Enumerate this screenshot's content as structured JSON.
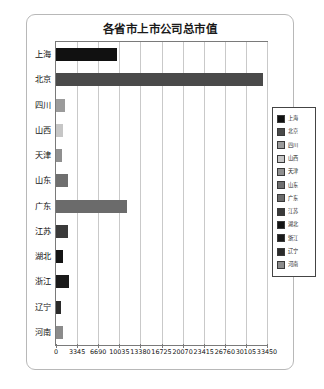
{
  "chart_data": {
    "type": "bar",
    "orientation": "horizontal",
    "title": "各省市上市公司总市值",
    "xlabel": "",
    "ylabel": "",
    "categories": [
      "上海",
      "北京",
      "四川",
      "山西",
      "天津",
      "山东",
      "广东",
      "江苏",
      "湖北",
      "浙江",
      "辽宁",
      "河南"
    ],
    "values": [
      9690,
      32800,
      1460,
      1060,
      900,
      1850,
      11280,
      1900,
      1060,
      2000,
      830,
      1060
    ],
    "colors": [
      "#111111",
      "#4a4a4a",
      "#9b9b9b",
      "#c6c6c6",
      "#8f8f8f",
      "#6f6f6f",
      "#6b6b6b",
      "#3a3a3a",
      "#141414",
      "#1a1a1a",
      "#2b2b2b",
      "#8b8b8b"
    ],
    "xlim": [
      0,
      33450
    ],
    "xticks": [
      0,
      3345,
      6690,
      10035,
      13380,
      16725,
      20070,
      23415,
      26760,
      30105,
      33450
    ],
    "xtick_labels": [
      "0",
      "3345",
      "6690",
      "10035",
      "13380",
      "16725",
      "20070",
      "23415",
      "26760",
      "30105",
      "33450"
    ],
    "grid": true,
    "legend_position": "right",
    "legend": [
      {
        "label": "上海",
        "color": "#111111"
      },
      {
        "label": "北京",
        "color": "#4a4a4a"
      },
      {
        "label": "四川",
        "color": "#9b9b9b"
      },
      {
        "label": "山西",
        "color": "#c6c6c6"
      },
      {
        "label": "天津",
        "color": "#8f8f8f"
      },
      {
        "label": "山东",
        "color": "#6f6f6f"
      },
      {
        "label": "广东",
        "color": "#6b6b6b"
      },
      {
        "label": "江苏",
        "color": "#3a3a3a"
      },
      {
        "label": "湖北",
        "color": "#141414"
      },
      {
        "label": "浙江",
        "color": "#1a1a1a"
      },
      {
        "label": "辽宁",
        "color": "#2b2b2b"
      },
      {
        "label": "河南",
        "color": "#8b8b8b"
      }
    ]
  }
}
